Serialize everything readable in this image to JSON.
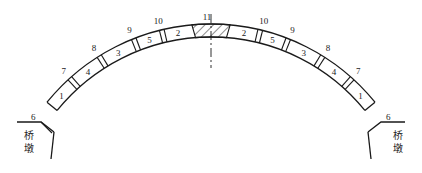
{
  "diagram": {
    "type": "arch-segment-layout",
    "segments_left": [
      "1",
      "4",
      "3",
      "5",
      "2"
    ],
    "segments_right": [
      "2",
      "5",
      "3",
      "4",
      "1"
    ],
    "crown_segment": "11",
    "joint_labels_left": [
      "6",
      "7",
      "8",
      "9",
      "10"
    ],
    "joint_labels_right": [
      "10",
      "9",
      "8",
      "7",
      "6"
    ],
    "pier_label_left": [
      "桥",
      "墩"
    ],
    "pier_label_right": [
      "桥",
      "墩"
    ],
    "colors": {
      "line": "#1a1a1a",
      "background": "#ffffff"
    }
  }
}
